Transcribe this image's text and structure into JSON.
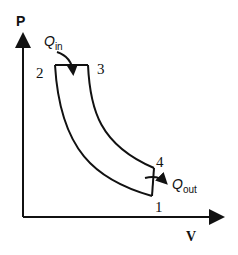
{
  "diagram": {
    "type": "PV diagram (Diesel cycle)",
    "axes": {
      "y_label": "P",
      "x_label": "V"
    },
    "points": [
      {
        "id": "1",
        "label": "1"
      },
      {
        "id": "2",
        "label": "2"
      },
      {
        "id": "3",
        "label": "3"
      },
      {
        "id": "4",
        "label": "4"
      }
    ],
    "heat": {
      "in_symbol": "Q",
      "in_sub": "in",
      "out_symbol": "Q",
      "out_sub": "out"
    }
  }
}
